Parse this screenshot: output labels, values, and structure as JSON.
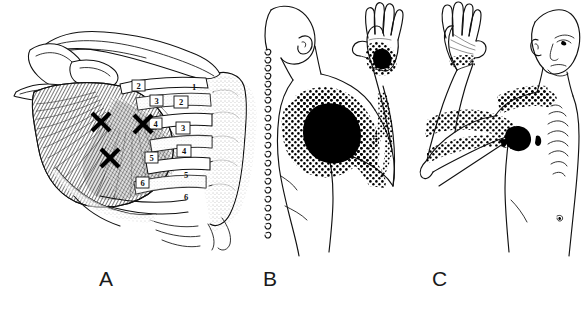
{
  "figure": {
    "type": "medical-anatomy-illustration",
    "background_color": "#ffffff",
    "ink_color": "#111111",
    "panel_count": 3
  },
  "captions": {
    "a": "A",
    "b": "B",
    "c": "C"
  },
  "panels": [
    {
      "id": "a",
      "caption": "A",
      "view": "anterolateral chest wall, deep dissection",
      "description": "Pectoralis minor muscle attachments on ribs with trigger point X marks, clavicle, scapula/coracoid, humerus and rib cage with vertebral column",
      "trigger_point_marks": [
        {
          "id": "tp-upper-medial",
          "x": 101,
          "y": 122
        },
        {
          "id": "tp-upper-lateral",
          "x": 143,
          "y": 124
        },
        {
          "id": "tp-lower",
          "x": 110,
          "y": 158
        }
      ],
      "rib_labels": [
        "2",
        "3",
        "4",
        "5",
        "6"
      ],
      "intercostal_labels": [
        "1",
        "2",
        "3",
        "4",
        "5",
        "6"
      ],
      "structures": [
        "clavicle",
        "coracoid process",
        "scapula",
        "humerus",
        "pectoralis minor",
        "ribs",
        "costal cartilage",
        "sternum",
        "vertebral column"
      ]
    },
    {
      "id": "b",
      "caption": "B",
      "view": "posterior / lateral body outline, arm elevated",
      "description": "Referred pain pattern: solid essential zone over anterior deltoid and pectoral region, spillover stippling over shoulder, medial arm, forearm and dorsum of hand",
      "pain_zones": [
        {
          "id": "essential-zone-shoulder",
          "style": "solid-black",
          "region": "anterior deltoid / pectoral"
        },
        {
          "id": "spillover-shoulder",
          "style": "stippled",
          "region": "shoulder and upper chest"
        },
        {
          "id": "spillover-medial-arm",
          "style": "stippled",
          "region": "medial arm and forearm"
        },
        {
          "id": "spillover-hand-dorsum",
          "style": "stippled",
          "region": "ulnar dorsum of hand"
        }
      ],
      "structures": [
        "head",
        "ear",
        "vertebral column dots",
        "trunk",
        "raised arm",
        "hand"
      ]
    },
    {
      "id": "c",
      "caption": "C",
      "view": "anterior body, arm elevated",
      "description": "Arrow indicating the axillary trigger point location with stippled referred pain over upper chest, medial arm, forearm and wrist",
      "pain_zones": [
        {
          "id": "essential-zone-axilla",
          "style": "solid-black",
          "region": "axilla / pectoral insertion"
        },
        {
          "id": "spillover-upper-chest",
          "style": "stippled",
          "region": "infraclavicular chest"
        },
        {
          "id": "spillover-medial-arm",
          "style": "stippled",
          "region": "medial arm and forearm"
        },
        {
          "id": "spillover-wrist",
          "style": "stippled",
          "region": "volar wrist"
        }
      ],
      "pointer": {
        "id": "axilla-arrow",
        "label": "",
        "points_to": "axillary trigger point"
      },
      "structures": [
        "head",
        "face",
        "ear",
        "neck",
        "sternum",
        "nipple",
        "umbilicus",
        "raised arm",
        "palm"
      ]
    }
  ]
}
